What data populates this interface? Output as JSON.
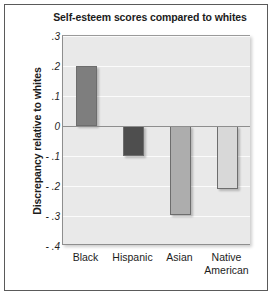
{
  "chart_data": {
    "type": "bar",
    "title": "Self-esteem scores compared to whites",
    "xlabel": "",
    "ylabel": "Discrepancy relative to whites",
    "categories": [
      "Black",
      "Hispanic",
      "Asian",
      "Native American"
    ],
    "category_lines": [
      [
        "Black"
      ],
      [
        "Hispanic"
      ],
      [
        "Asian"
      ],
      [
        "Native",
        "American"
      ]
    ],
    "values": [
      0.2,
      -0.1,
      -0.295,
      -0.21
    ],
    "ylim": [
      -0.4,
      0.3
    ],
    "yticks": [
      0.3,
      0.2,
      0.1,
      0,
      -0.1,
      -0.2,
      -0.3,
      -0.4
    ],
    "ytick_labels": [
      ".3",
      ".2",
      ".1",
      "0",
      "- .1",
      "- .2",
      "- .3",
      "- .4"
    ],
    "grid": true,
    "legend": "none",
    "bar_colors": [
      "#7e7e7e",
      "#4e4e4e",
      "#adadad",
      "#d8d8d8"
    ],
    "plot_background": "#e9e9e9",
    "gridline_color": "#fbfbfb",
    "axis_color": "#8e8e8e"
  }
}
